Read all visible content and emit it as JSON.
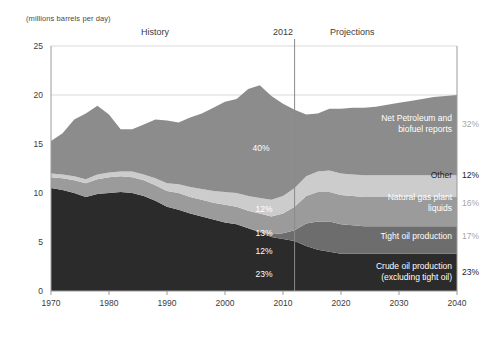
{
  "chart_data": {
    "type": "area",
    "title": "",
    "subtitle": "",
    "units_label": "(millions barrels per day)",
    "xlabel": "",
    "ylabel": "",
    "xlim": [
      1970,
      2040
    ],
    "ylim": [
      0,
      25
    ],
    "grid": true,
    "legend_position": "inline-right",
    "xticks": [
      "1970",
      "1980",
      "1990",
      "2000",
      "2010",
      "2020",
      "2030",
      "2040"
    ],
    "xtick_values": [
      1970,
      1980,
      1990,
      2000,
      2010,
      2020,
      2030,
      2040
    ],
    "yticks": [
      "0",
      "5",
      "10",
      "15",
      "20",
      "25"
    ],
    "ytick_values": [
      0,
      5,
      10,
      15,
      20,
      25
    ],
    "annotations": {
      "history": "History",
      "divider_year": "2012",
      "projections": "Projections",
      "divider_x": 2012
    },
    "x": [
      1970,
      1972,
      1974,
      1976,
      1978,
      1980,
      1982,
      1984,
      1986,
      1988,
      1990,
      1992,
      1994,
      1996,
      1998,
      2000,
      2002,
      2004,
      2006,
      2008,
      2010,
      2012,
      2014,
      2016,
      2018,
      2020,
      2022,
      2024,
      2026,
      2028,
      2030,
      2032,
      2034,
      2036,
      2038,
      2040
    ],
    "series": [
      {
        "name": "Crude oil production (excluding tight oil)",
        "color": "#2b2b2b",
        "label_color": "#ffffff",
        "end_share_pct": 23,
        "inner_pct_label": "23%",
        "right_pct_label": "23%",
        "values": [
          10.5,
          10.3,
          10.0,
          9.6,
          9.9,
          10.0,
          10.1,
          10.0,
          9.7,
          9.2,
          8.6,
          8.3,
          7.9,
          7.6,
          7.3,
          7.0,
          6.8,
          6.4,
          6.0,
          5.5,
          5.3,
          5.1,
          4.6,
          4.2,
          4.0,
          3.8,
          3.8,
          3.8,
          3.8,
          3.8,
          3.8,
          3.8,
          3.8,
          3.8,
          3.8,
          3.8
        ]
      },
      {
        "name": "Tight oil production",
        "color": "#6d6d6d",
        "label_color": "#ffffff",
        "end_share_pct": 17,
        "inner_pct_label": "12%",
        "right_pct_label": "17%",
        "values": [
          0.0,
          0.0,
          0.0,
          0.0,
          0.0,
          0.0,
          0.0,
          0.0,
          0.0,
          0.0,
          0.0,
          0.0,
          0.0,
          0.0,
          0.0,
          0.0,
          0.0,
          0.0,
          0.1,
          0.3,
          0.6,
          1.1,
          2.3,
          2.9,
          3.1,
          3.0,
          2.9,
          2.8,
          2.8,
          2.8,
          2.8,
          2.8,
          2.8,
          2.8,
          2.8,
          2.8
        ]
      },
      {
        "name": "Natural gas plant liquids",
        "color": "#9b9b9b",
        "label_color": "#ffffff",
        "end_share_pct": 16,
        "inner_pct_label": "13%",
        "right_pct_label": "16%",
        "values": [
          1.1,
          1.2,
          1.3,
          1.4,
          1.5,
          1.6,
          1.6,
          1.6,
          1.6,
          1.6,
          1.6,
          1.7,
          1.7,
          1.7,
          1.7,
          1.8,
          1.8,
          1.8,
          1.8,
          1.8,
          2.0,
          2.4,
          2.8,
          3.0,
          3.0,
          3.0,
          3.0,
          3.0,
          3.0,
          3.0,
          3.0,
          3.0,
          3.0,
          3.0,
          3.0,
          3.0
        ]
      },
      {
        "name": "Other",
        "color": "#cccccc",
        "label_color": "#222222",
        "end_share_pct": 12,
        "inner_pct_label": "12%",
        "right_pct_label": "12%",
        "values": [
          0.4,
          0.4,
          0.4,
          0.4,
          0.5,
          0.5,
          0.5,
          0.6,
          0.6,
          0.7,
          0.8,
          0.9,
          1.0,
          1.1,
          1.2,
          1.3,
          1.4,
          1.5,
          1.6,
          1.7,
          1.8,
          1.9,
          2.0,
          2.1,
          2.2,
          2.2,
          2.2,
          2.2,
          2.2,
          2.2,
          2.2,
          2.2,
          2.2,
          2.2,
          2.2,
          2.2
        ]
      },
      {
        "name": "Net Petroleum and biofuel reports",
        "color": "#8c8c8c",
        "label_color": "#ffffff",
        "end_share_pct": 32,
        "inner_pct_label": "40%",
        "right_pct_label": "32%",
        "values": [
          3.3,
          4.2,
          5.8,
          6.7,
          7.0,
          5.9,
          4.3,
          4.3,
          5.1,
          6.0,
          6.4,
          6.3,
          7.1,
          7.7,
          8.5,
          9.2,
          9.6,
          10.9,
          11.5,
          10.6,
          9.4,
          8.0,
          6.3,
          5.9,
          6.3,
          6.6,
          6.8,
          6.9,
          7.0,
          7.2,
          7.4,
          7.6,
          7.8,
          8.0,
          8.1,
          8.2
        ]
      }
    ],
    "series_callouts": [
      {
        "name": "Net Petroleum and biofuel reports",
        "text": "Net Petroleum and\nbiofuel reports",
        "pct": "32%",
        "y_px": 124
      },
      {
        "name": "Other",
        "text": "Other",
        "pct": "12%",
        "y_px": 175
      },
      {
        "name": "Natural gas plant liquids",
        "text": "Natural gas plant\nliquids",
        "pct": "16%",
        "y_px": 203
      },
      {
        "name": "Tight oil production",
        "text": "Tight oil production",
        "pct": "17%",
        "y_px": 236
      },
      {
        "name": "Crude oil production (excluding tight oil)",
        "text": "Crude oil production\n(excluding tight oil)",
        "pct": "23%",
        "y_px": 272
      }
    ],
    "inner_pct_markers": [
      {
        "label": "40%",
        "x_px": 261,
        "y_px": 148
      },
      {
        "label": "12%",
        "x_px": 264,
        "y_px": 209
      },
      {
        "label": "13%",
        "x_px": 264,
        "y_px": 233
      },
      {
        "label": "12%",
        "x_px": 264,
        "y_px": 251
      },
      {
        "label": "23%",
        "x_px": 264,
        "y_px": 274
      }
    ],
    "colors": {
      "background": "#ffffff",
      "gridline": "#d9d9d9",
      "axis": "#9a9a9a",
      "divider": "#8a8a8a",
      "tick_text": "#3b3b3b"
    }
  }
}
